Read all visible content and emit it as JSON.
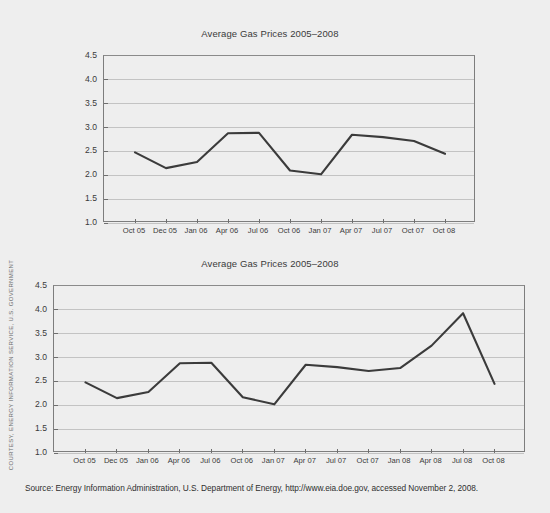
{
  "page": {
    "background_color": "#eeeeee",
    "credit_label": "COURTESY, ENERGY INFORMATION SERVICE, U.S. GOVERNMENT",
    "source_note": "Source: Energy Information Administration, U.S. Department of Energy, http://www.eia.doe.gov, accessed November 2, 2008.",
    "line_color": "#3b3b3b",
    "grid_color": "#c3c3c3",
    "axis_color": "#7d7d7d"
  },
  "chart_data": [
    {
      "id": "chart-top",
      "type": "line",
      "title": "Average Gas Prices 2005–2008",
      "xlabel": "",
      "ylabel": "",
      "ylim": [
        1.0,
        4.5
      ],
      "yticks": [
        "4.5",
        "4.0",
        "3.5",
        "3.0",
        "2.5",
        "2.0",
        "1.5",
        "1.0"
      ],
      "ytick_values": [
        4.5,
        4.0,
        3.5,
        3.0,
        2.5,
        2.0,
        1.5,
        1.0
      ],
      "grid": true,
      "legend": "none",
      "categories": [
        "Oct 05",
        "Dec 05",
        "Jan 06",
        "Apr 06",
        "Jul 06",
        "Oct 06",
        "Jan 07",
        "Apr 07",
        "Jul 07",
        "Oct 07",
        "Oct 08"
      ],
      "values": [
        2.48,
        2.15,
        2.28,
        2.88,
        2.89,
        2.1,
        2.02,
        2.85,
        2.8,
        2.72,
        2.45
      ]
    },
    {
      "id": "chart-bottom",
      "type": "line",
      "title": "Average Gas Prices 2005–2008",
      "xlabel": "",
      "ylabel": "",
      "ylim": [
        1.0,
        4.5
      ],
      "yticks": [
        "4.5",
        "4.0",
        "3.5",
        "3.0",
        "2.5",
        "2.0",
        "1.5",
        "1.0"
      ],
      "ytick_values": [
        4.5,
        4.0,
        3.5,
        3.0,
        2.5,
        2.0,
        1.5,
        1.0
      ],
      "grid": true,
      "legend": "none",
      "categories": [
        "Oct 05",
        "Dec 05",
        "Jan 06",
        "Apr 06",
        "Jul 06",
        "Oct 06",
        "Jan 07",
        "Apr 07",
        "Jul 07",
        "Oct 07",
        "Jan 08",
        "Apr 08",
        "Jul 08",
        "Oct 08"
      ],
      "values": [
        2.48,
        2.15,
        2.28,
        2.88,
        2.89,
        2.17,
        2.02,
        2.85,
        2.8,
        2.72,
        2.78,
        3.25,
        3.93,
        2.45
      ]
    }
  ]
}
